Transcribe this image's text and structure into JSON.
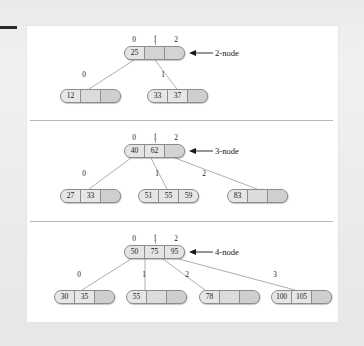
{
  "figure": {
    "background_color": "#efeeec",
    "card_color": "#ffffff",
    "node_fill": "#dcdcdc",
    "node_border": "#8d8d8d",
    "link_color": "#9a9a9a",
    "text_color": "#1b1b1b"
  },
  "sections": [
    {
      "id": "two-node",
      "callout": "2-node",
      "root": {
        "index_labels": [
          "0",
          "1",
          "2"
        ],
        "cells": [
          "25",
          "",
          ""
        ]
      },
      "children": [
        {
          "edge_label": "0",
          "cells": [
            "12",
            "",
            ""
          ]
        },
        {
          "edge_label": "1",
          "cells": [
            "33",
            "37",
            ""
          ]
        }
      ]
    },
    {
      "id": "three-node",
      "callout": "3-node",
      "root": {
        "index_labels": [
          "0",
          "1",
          "2"
        ],
        "cells": [
          "40",
          "62",
          ""
        ]
      },
      "children": [
        {
          "edge_label": "0",
          "cells": [
            "27",
            "33",
            ""
          ]
        },
        {
          "edge_label": "1",
          "cells": [
            "51",
            "55",
            "59"
          ]
        },
        {
          "edge_label": "2",
          "cells": [
            "83",
            "",
            ""
          ]
        }
      ]
    },
    {
      "id": "four-node",
      "callout": "4-node",
      "root": {
        "index_labels": [
          "0",
          "1",
          "2"
        ],
        "cells": [
          "50",
          "75",
          "95"
        ]
      },
      "children": [
        {
          "edge_label": "0",
          "cells": [
            "30",
            "35",
            ""
          ]
        },
        {
          "edge_label": "1",
          "cells": [
            "55",
            "",
            ""
          ]
        },
        {
          "edge_label": "2",
          "cells": [
            "78",
            "",
            ""
          ]
        },
        {
          "edge_label": "3",
          "cells": [
            "100",
            "105",
            ""
          ]
        }
      ]
    }
  ]
}
